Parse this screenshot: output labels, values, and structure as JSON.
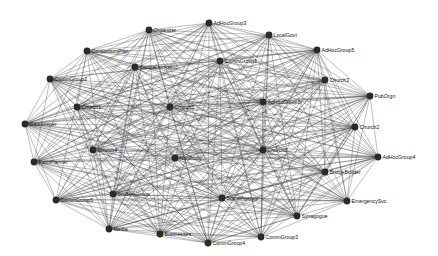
{
  "diagram": {
    "type": "network-graph",
    "layout": "circular-ellipse",
    "colors": {
      "edge": "#3a3a3a",
      "node": "#2a2a2a",
      "label": "#111111",
      "background": "#ffffff"
    },
    "nodes": [
      {
        "id": "AdHocGroup3",
        "label": "AdHocGroup3",
        "x": 209,
        "y": 23
      },
      {
        "id": "Organizer",
        "label": "Organizer",
        "x": 149,
        "y": 30
      },
      {
        "id": "LocalGovt",
        "label": "LocalGovt",
        "x": 269,
        "y": 35
      },
      {
        "id": "ConsortiumPlan",
        "label": "ConsortiumPlan",
        "x": 87,
        "y": 51
      },
      {
        "id": "AdHocGroup5",
        "label": "AdHocGroup5",
        "x": 317,
        "y": 50
      },
      {
        "id": "CommGroup1",
        "label": "CommGroup1",
        "x": 220,
        "y": 61
      },
      {
        "id": "ContractorAssoc",
        "label": "ContractorAssoc",
        "x": 135,
        "y": 67
      },
      {
        "id": "CommGroup2",
        "label": "CommGroup2",
        "x": 50,
        "y": 79
      },
      {
        "id": "Church3",
        "label": "Church3",
        "x": 325,
        "y": 80
      },
      {
        "id": "PubOrgn",
        "label": "PubOrgn",
        "x": 370,
        "y": 96
      },
      {
        "id": "Church1",
        "label": "Church1",
        "x": 77,
        "y": 107
      },
      {
        "id": "Church5",
        "label": "Church5",
        "x": 170,
        "y": 107
      },
      {
        "id": "AdHocGroup1",
        "label": "AdHocGroup1",
        "x": 263,
        "y": 102
      },
      {
        "id": "Gatekeeper",
        "label": "Gatekeeper",
        "x": 25,
        "y": 124
      },
      {
        "id": "Church2",
        "label": "Church2",
        "x": 355,
        "y": 127
      },
      {
        "id": "Church4",
        "label": "Church4",
        "x": 93,
        "y": 150
      },
      {
        "id": "NonProfit",
        "label": "NonProfit",
        "x": 175,
        "y": 158
      },
      {
        "id": "Church6",
        "label": "Church6",
        "x": 263,
        "y": 150
      },
      {
        "id": "AdHocGroup4",
        "label": "AdHocGroup4",
        "x": 378,
        "y": 157
      },
      {
        "id": "FaithPlanner",
        "label": "FaithPlanner",
        "x": 34,
        "y": 162
      },
      {
        "id": "BridgeBuilder",
        "label": "BridgeBuilder",
        "x": 325,
        "y": 172
      },
      {
        "id": "CommGroup5",
        "label": "CommGroup5",
        "x": 56,
        "y": 200
      },
      {
        "id": "StudentGroup",
        "label": "StudentGroup",
        "x": 113,
        "y": 194
      },
      {
        "id": "SocialAgency",
        "label": "SocialAgency",
        "x": 222,
        "y": 198
      },
      {
        "id": "EmergencySvc",
        "label": "EmergencySvc",
        "x": 347,
        "y": 201
      },
      {
        "id": "Synagogue",
        "label": "Synagogue",
        "x": 297,
        "y": 216
      },
      {
        "id": "Media",
        "label": "Media",
        "x": 109,
        "y": 229
      },
      {
        "id": "Businesses",
        "label": "Businesses",
        "x": 160,
        "y": 234
      },
      {
        "id": "CommGroup4",
        "label": "CommGroup4",
        "x": 208,
        "y": 243
      },
      {
        "id": "CommGroup3",
        "label": "CommGroup3",
        "x": 261,
        "y": 237
      }
    ],
    "edge_density": 0.85
  }
}
